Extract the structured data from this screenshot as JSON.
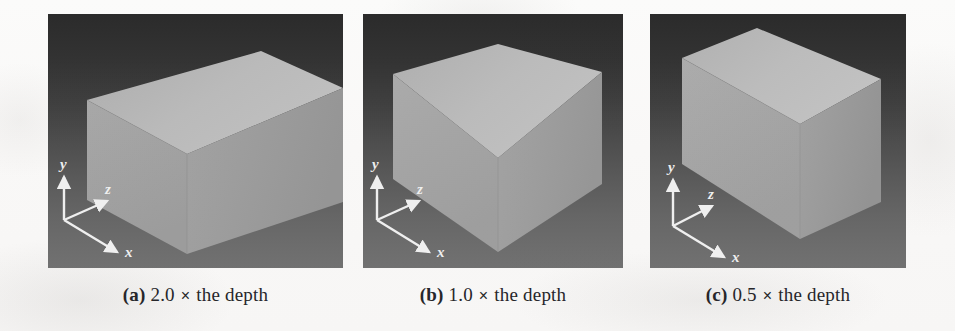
{
  "figure": {
    "kind": "3d-render-comparison",
    "panel_count": 3,
    "background_color": "#ffffff",
    "render_backdrop_top_color": "#2a2a2a",
    "render_backdrop_bottom_color": "#717171",
    "box_top_face_color": "#b6b6b6",
    "box_left_face_color": "#a6a6a6",
    "box_right_face_color": "#9a9a9a",
    "axis_label_color": "#f2f2f2"
  },
  "panels": [
    {
      "id": "a",
      "label": "(a)",
      "scale": "2.0",
      "multiply_symbol": "×",
      "description": "the depth",
      "caption_full": "(a) 2.0 × the depth",
      "axes": {
        "x": "x",
        "y": "y",
        "z": "z"
      }
    },
    {
      "id": "b",
      "label": "(b)",
      "scale": "1.0",
      "multiply_symbol": "×",
      "description": "the depth",
      "caption_full": "(b) 1.0 × the depth",
      "axes": {
        "x": "x",
        "y": "y",
        "z": "z"
      }
    },
    {
      "id": "c",
      "label": "(c)",
      "scale": "0.5",
      "multiply_symbol": "×",
      "description": "the depth",
      "caption_full": "(c) 0.5 × the depth",
      "axes": {
        "x": "x",
        "y": "y",
        "z": "z"
      }
    }
  ]
}
